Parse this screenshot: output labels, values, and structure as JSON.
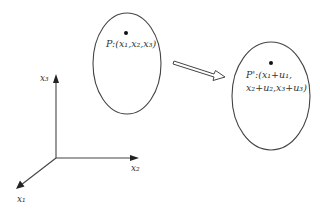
{
  "diagram": {
    "colors": {
      "stroke": "#444444",
      "background": "#ffffff",
      "point": "#111111"
    },
    "axes": {
      "x1_label": "x₁",
      "x2_label": "x₂",
      "x3_label": "x₃"
    },
    "body_initial": {
      "point_label": "P:(x₁,x₂,x₃)"
    },
    "body_deformed": {
      "point_label_line1": "P':(x₁+u₁,",
      "point_label_line2": "x₂+u₂,x₃+u₃)"
    },
    "arrow": {
      "style": "hollow-block-arrow",
      "direction": "right-down"
    }
  }
}
